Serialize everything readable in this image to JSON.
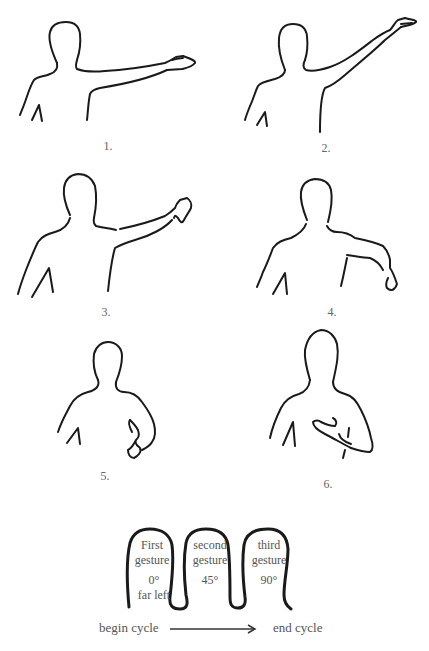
{
  "figures": [
    {
      "number": "1.",
      "pose": "arm extended horizontally to the side, palm up"
    },
    {
      "number": "2.",
      "pose": "arm raised diagonally upward, hand open"
    },
    {
      "number": "3.",
      "pose": "arm extended forward-diagonal, hand raised"
    },
    {
      "number": "4.",
      "pose": "arm lowered diagonally, hand drooping"
    },
    {
      "number": "5.",
      "pose": "arm bent at elbow, hand at waist"
    },
    {
      "number": "6.",
      "pose": "hand placed on chest"
    }
  ],
  "diagram": {
    "gestures": [
      {
        "line1": "First",
        "line2": "gesture",
        "angle": "0°",
        "position": "far left"
      },
      {
        "line1": "second",
        "line2": "gesture",
        "angle": "45°",
        "position": ""
      },
      {
        "line1": "third",
        "line2": "gesture",
        "angle": "90°",
        "position": ""
      }
    ],
    "begin_label": "begin cycle",
    "end_label": "end cycle",
    "arrow": "right-arrow"
  }
}
